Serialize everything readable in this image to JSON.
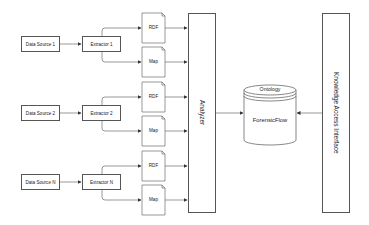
{
  "diagram": {
    "title": "",
    "colors": {
      "stroke": "#555555",
      "fill": "#ffffff",
      "text": "#222222"
    },
    "sources": [
      {
        "label": "Data Source 1",
        "extractor": "Extractor 1",
        "outputs": [
          "RDF",
          "Map"
        ]
      },
      {
        "label": "Data Source 2",
        "extractor": "Extractor 2",
        "outputs": [
          "RDF",
          "Map"
        ]
      },
      {
        "label": "Data Source N",
        "extractor": "Extractor N",
        "outputs": [
          "RDF",
          "Map"
        ]
      }
    ],
    "analyzer": {
      "label": "Analyzer"
    },
    "database": {
      "top_label": "Ontology",
      "label": "ForensicFlow"
    },
    "interface": {
      "label": "Knowledge Access Interface"
    }
  }
}
